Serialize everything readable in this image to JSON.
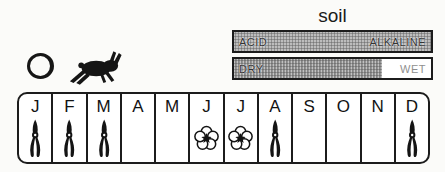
{
  "legend": {
    "sun_symbol": "open-circle",
    "animal_symbol": "leaping-hare"
  },
  "soil": {
    "title": "soil",
    "ph_bar": {
      "left_label": "ACID",
      "right_label": "ALKALINE",
      "fill_percent": 100
    },
    "moisture_bar": {
      "left_label": "DRY",
      "right_label": "WET",
      "fill_percent": 75
    }
  },
  "calendar": {
    "months": [
      {
        "label": "J",
        "icon": "shears"
      },
      {
        "label": "F",
        "icon": "shears"
      },
      {
        "label": "M",
        "icon": "shears"
      },
      {
        "label": "A",
        "icon": null
      },
      {
        "label": "M",
        "icon": null
      },
      {
        "label": "J",
        "icon": "flower"
      },
      {
        "label": "J",
        "icon": "flower"
      },
      {
        "label": "A",
        "icon": "shears"
      },
      {
        "label": "S",
        "icon": null
      },
      {
        "label": "O",
        "icon": null
      },
      {
        "label": "N",
        "icon": null
      },
      {
        "label": "D",
        "icon": "shears"
      }
    ]
  },
  "colors": {
    "border_black": "#1c1c1c",
    "bar_fill_gray": "#bdbdbd",
    "bar_fill_dark": "#8a8a8a",
    "wet_label_gray": "#8f8f8f"
  }
}
